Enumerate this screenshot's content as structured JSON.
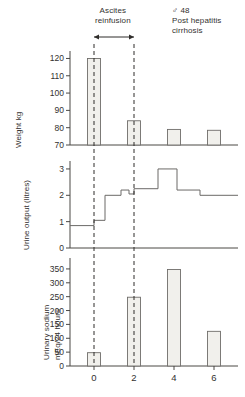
{
  "annotations": {
    "intervention_label_line1": "Ascites",
    "intervention_label_line2": "reinfusion",
    "patient_sex_age": "♂ 48",
    "patient_dx_line1": "Post hepatitis",
    "patient_dx_line2": "cirrhosis"
  },
  "axis_titles": {
    "weight": "Weight kg",
    "urine": "Urine output (litres)",
    "sodium_line1": "Urinary sodium",
    "sodium_line2": "mEq/24 hours"
  },
  "colors": {
    "background": "#ffffff",
    "ink": "#33312f",
    "axis": "#4a4845",
    "bar_fill": "#f1f0ec",
    "bar_stroke": "#6f6d6a",
    "step_line": "#6b6967",
    "dashed_marker": "#2f2d2b"
  },
  "chart_data": [
    {
      "type": "bar",
      "title": "Weight kg",
      "xlabel": "",
      "ylabel": "Weight kg",
      "x": [
        0,
        2,
        4,
        6
      ],
      "categories": [
        "0",
        "2",
        "4",
        "6"
      ],
      "values": [
        120,
        84,
        79,
        78.5
      ],
      "ylim": [
        70,
        122
      ],
      "yticks": [
        70,
        80,
        90,
        100,
        110,
        120
      ],
      "ytick_labels": [
        "70",
        "80",
        "90",
        "100",
        "110",
        "120"
      ],
      "xlim": [
        -1.2,
        7.2
      ],
      "grid": false,
      "legend": "none",
      "baseline": 70
    },
    {
      "type": "line",
      "title": "Urine output (litres)",
      "xlabel": "",
      "ylabel": "Urine output (litres)",
      "drawstyle": "steps",
      "ylim": [
        0,
        3.15
      ],
      "yticks": [
        0,
        1,
        2,
        3
      ],
      "ytick_labels": [
        "0",
        "1",
        "2",
        "3"
      ],
      "xlim": [
        -1.2,
        7.2
      ],
      "grid": false,
      "legend": "none",
      "steps": [
        {
          "x_start": -1.2,
          "x_end": 0.0,
          "value": 0.85
        },
        {
          "x_start": 0.0,
          "x_end": 0.55,
          "value": 1.05
        },
        {
          "x_start": 0.55,
          "x_end": 1.35,
          "value": 2.0
        },
        {
          "x_start": 1.35,
          "x_end": 1.75,
          "value": 2.2
        },
        {
          "x_start": 1.75,
          "x_end": 2.0,
          "value": 2.05
        },
        {
          "x_start": 2.0,
          "x_end": 3.2,
          "value": 2.25
        },
        {
          "x_start": 3.2,
          "x_end": 4.15,
          "value": 3.0
        },
        {
          "x_start": 4.15,
          "x_end": 5.3,
          "value": 2.2
        },
        {
          "x_start": 5.3,
          "x_end": 7.2,
          "value": 2.0
        }
      ]
    },
    {
      "type": "bar",
      "title": "Urinary sodium mEq/24 hours",
      "xlabel": "",
      "ylabel": "Urinary sodium mEq/24 hours",
      "x": [
        0,
        2,
        4,
        6
      ],
      "categories": [
        "0",
        "2",
        "4",
        "6"
      ],
      "values": [
        48,
        248,
        348,
        125
      ],
      "ylim": [
        0,
        375
      ],
      "yticks": [
        0,
        50,
        100,
        150,
        200,
        250,
        300,
        350
      ],
      "ytick_labels": [
        "0",
        "50",
        "100",
        "150",
        "200",
        "250",
        "300",
        "350"
      ],
      "xlim": [
        -1.2,
        7.2
      ],
      "xticks": [
        0,
        2,
        4,
        6
      ],
      "xtick_labels": [
        "0",
        "2",
        "4",
        "6"
      ],
      "grid": false,
      "legend": "none"
    }
  ],
  "markers": {
    "dashed_vertical_x": [
      0,
      2
    ],
    "arrow_span": {
      "from": 0,
      "to": 2,
      "double_headed": true
    }
  }
}
